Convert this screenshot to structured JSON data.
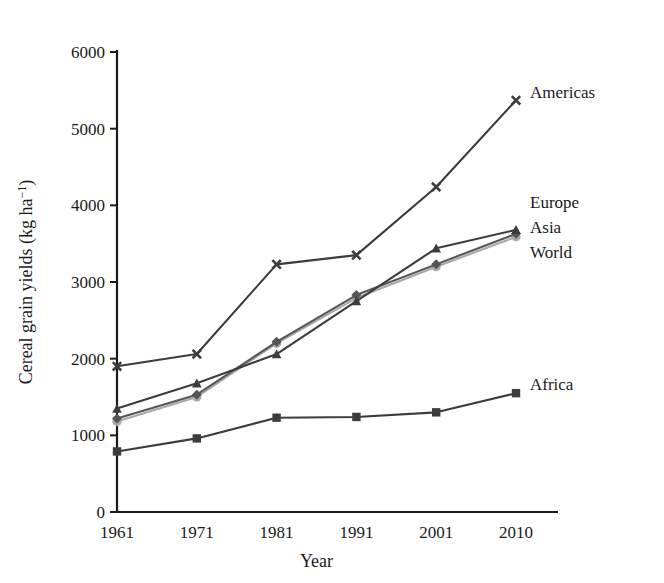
{
  "chart_data": {
    "type": "line",
    "title": "",
    "xlabel": "Year",
    "ylabel": "Cereal grain yields (kg ha−1)",
    "ylabel_parts": {
      "base": "Cereal grain yields (kg ha",
      "sup": "−1",
      "tail": ")"
    },
    "x": [
      1961,
      1971,
      1981,
      1991,
      2001,
      2010
    ],
    "xticklabels": [
      "1961",
      "1971",
      "1981",
      "1991",
      "2001",
      "2010"
    ],
    "yticks": [
      0,
      1000,
      2000,
      3000,
      4000,
      5000,
      6000
    ],
    "yticklabels": [
      "0",
      "1000",
      "2000",
      "3000",
      "4000",
      "5000",
      "6000"
    ],
    "xlim": [
      1961,
      2010
    ],
    "ylim": [
      0,
      6000
    ],
    "grid": false,
    "legend_position": "right-inline-labels",
    "series": [
      {
        "name": "Americas",
        "color": "#3c3c3c",
        "marker": "x",
        "values": [
          1900,
          2060,
          3230,
          3350,
          4240,
          5370
        ]
      },
      {
        "name": "Europe",
        "color": "#3c3c3c",
        "marker": "triangle",
        "values": [
          1350,
          1680,
          2060,
          2750,
          3440,
          3680
        ]
      },
      {
        "name": "Asia",
        "color": "#555555",
        "marker": "diamond",
        "values": [
          1220,
          1530,
          2220,
          2830,
          3230,
          3630
        ]
      },
      {
        "name": "World",
        "color": "#a8a8a8",
        "marker": "circle",
        "values": [
          1180,
          1500,
          2200,
          2790,
          3200,
          3590
        ]
      },
      {
        "name": "Africa",
        "color": "#3c3c3c",
        "marker": "square",
        "values": [
          790,
          960,
          1230,
          1240,
          1300,
          1550
        ]
      }
    ]
  },
  "axis": {
    "x_title": "Year",
    "y_title_base": "Cereal grain yields (kg ha",
    "y_title_sup": "−1",
    "y_title_tail": ")"
  },
  "labels": {
    "americas": "Americas",
    "europe": "Europe",
    "asia": "Asia",
    "world": "World",
    "africa": "Africa"
  }
}
